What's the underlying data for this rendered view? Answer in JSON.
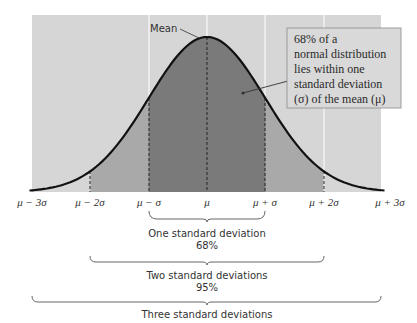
{
  "chart_data": {
    "type": "area",
    "title": "",
    "x_ticks": [
      "μ − 3σ",
      "μ − 2σ",
      "μ − σ",
      "μ",
      "μ + σ",
      "μ + 2σ",
      "μ + 3σ"
    ],
    "x_range_sigma": [
      -3,
      3
    ],
    "curve": "standard normal density",
    "regions": [
      {
        "name": "within one standard deviation",
        "from": -1,
        "to": 1,
        "shade": "#7a7a7a"
      },
      {
        "name": "within two standard deviations",
        "from": -2,
        "to": 2,
        "shade": "#a9a9a9"
      },
      {
        "name": "within three standard deviations",
        "from": -3,
        "to": 3,
        "shade": "#d6d6d6"
      }
    ],
    "annotations": {
      "mean_label": "Mean",
      "callout": [
        "68% of a",
        "normal distribution",
        "lies within one",
        "standard deviation",
        "(σ) of the mean (μ)"
      ]
    },
    "brackets": [
      {
        "label": "One standard deviation",
        "percent": "68%",
        "from": -1,
        "to": 1
      },
      {
        "label": "Two standard deviations",
        "percent": "95%",
        "from": -2,
        "to": 2
      },
      {
        "label": "Three standard deviations",
        "percent": "",
        "from": -3,
        "to": 3
      }
    ],
    "grid": true
  },
  "colors": {
    "panel": "#d6d6d6",
    "two_sigma": "#a9a9a9",
    "one_sigma": "#7a7a7a",
    "curve": "#111111",
    "gridline": "#f2f2f2"
  }
}
